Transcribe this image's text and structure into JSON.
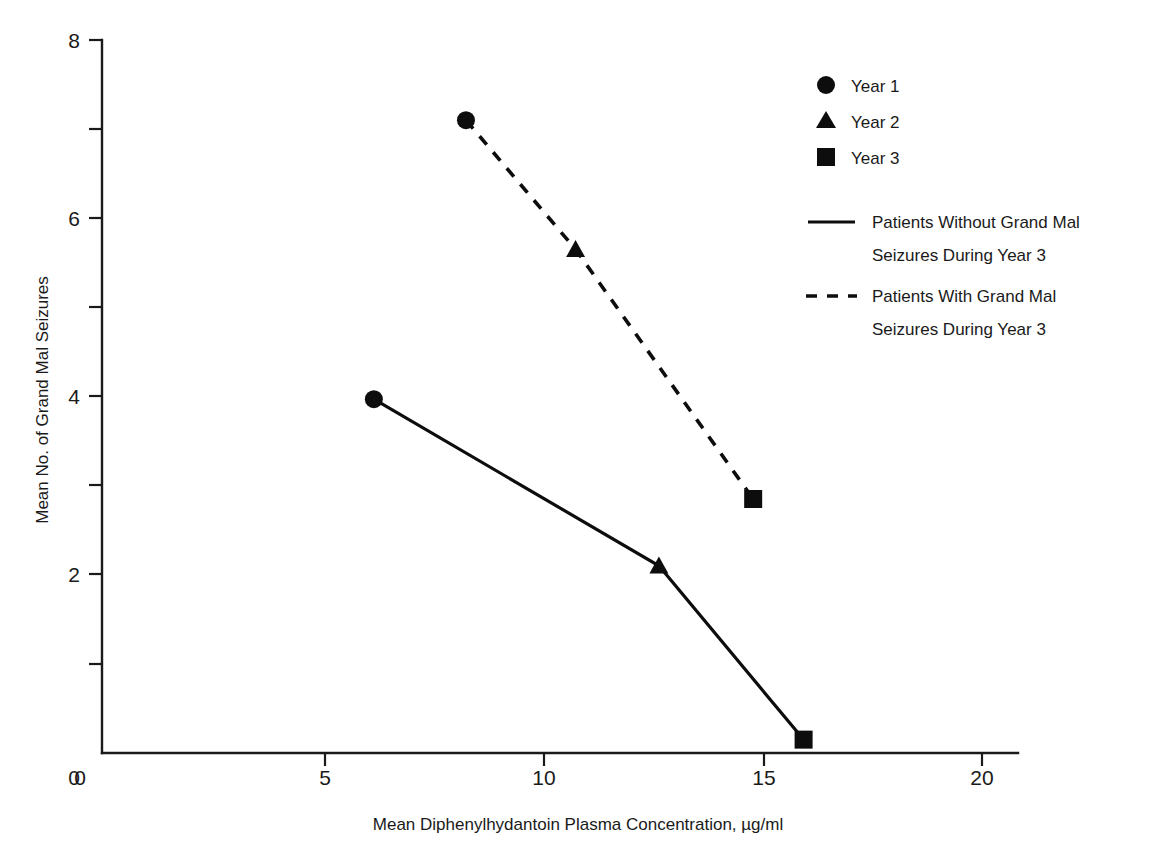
{
  "chart_data": {
    "type": "line",
    "title": "",
    "xlabel": "Mean Diphenylhydantoin Plasma Concentration, µg/ml",
    "ylabel": "Mean No. of Grand Mal Seizures",
    "xlim": [
      0,
      22.5
    ],
    "ylim": [
      0,
      8
    ],
    "x_ticks": [
      0,
      5,
      10,
      15,
      20
    ],
    "x_tick_labels": [
      "0",
      "5",
      "10",
      "15",
      "20"
    ],
    "y_ticks": [
      0,
      1,
      2,
      3,
      4,
      5,
      6,
      7,
      8
    ],
    "y_tick_labels": [
      "0",
      "",
      "2",
      "",
      "4",
      "",
      "6",
      "",
      "8"
    ],
    "y_major_ticks": [
      0,
      2,
      4,
      6,
      8
    ],
    "y_minor_ticks": [
      1,
      3,
      5,
      7
    ],
    "grid": false,
    "legend_position": "upper right",
    "series": [
      {
        "name": "Patients Without Grand Mal Seizures During Year 3",
        "style": "solid",
        "points": [
          {
            "label": "Year 1",
            "marker": "circle",
            "x": 6.2,
            "y": 3.97
          },
          {
            "label": "Year 2",
            "marker": "triangle",
            "x": 12.7,
            "y": 2.1
          },
          {
            "label": "Year 3",
            "marker": "square",
            "x": 16.0,
            "y": 0.15
          }
        ]
      },
      {
        "name": "Patients With Grand Mal Seizures During Year 3",
        "style": "dashed",
        "points": [
          {
            "label": "Year 1",
            "marker": "circle",
            "x": 8.3,
            "y": 7.1
          },
          {
            "label": "Year 2",
            "marker": "triangle",
            "x": 10.8,
            "y": 5.65
          },
          {
            "label": "Year 3",
            "marker": "square",
            "x": 14.85,
            "y": 2.85
          }
        ]
      }
    ],
    "marker_legend": [
      {
        "marker": "circle",
        "label": "Year 1"
      },
      {
        "marker": "triangle",
        "label": "Year 2"
      },
      {
        "marker": "square",
        "label": "Year 3"
      }
    ],
    "line_legend": [
      {
        "style": "solid",
        "line1": "Patients Without Grand Mal",
        "line2": "Seizures During Year 3"
      },
      {
        "style": "dashed",
        "line1": "Patients With Grand Mal",
        "line2": "Seizures During Year 3"
      }
    ],
    "colors": {
      "ink": "#0d0d0d",
      "axis": "#1a1a1a",
      "background": "#ffffff"
    }
  }
}
